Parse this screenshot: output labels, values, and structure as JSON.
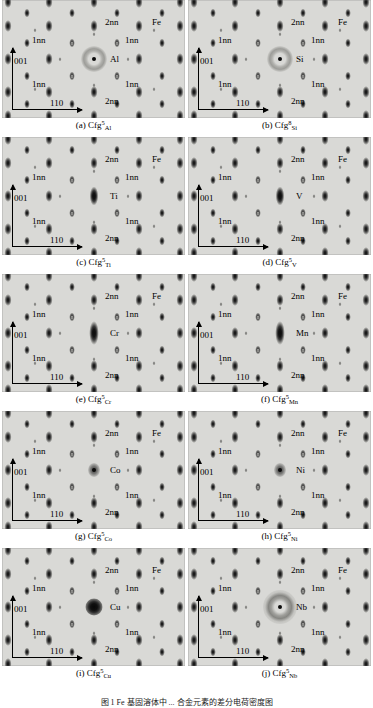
{
  "figure": {
    "width": 373,
    "height": 708,
    "title_partial": "图 1  Fe 基固溶体中 ... 合金元素的差分电荷密度图",
    "background": "#d9d9d6",
    "columns": 2,
    "rows": 5
  },
  "common_labels": {
    "host_atom": "Fe",
    "first_neighbor": "1nn",
    "second_neighbor": "2nn",
    "axis_vertical": "001",
    "axis_horizontal": "110"
  },
  "panels": [
    {
      "id": "a",
      "caption_prefix": "(a)",
      "caption_base": "Cfg",
      "caption_sup": "5",
      "caption_sub": "Al",
      "solute": "Al",
      "center_style": "halo",
      "labels": {
        "axis_vertical": "001",
        "axis_horizontal": "110",
        "host_atom": "Fe",
        "nn1": "1nn",
        "nn2": "2nn"
      }
    },
    {
      "id": "b",
      "caption_prefix": "(b)",
      "caption_base": "Cfg",
      "caption_sup": "8",
      "caption_sub": "Si",
      "solute": "Si",
      "center_style": "halo",
      "labels": {
        "axis_vertical": "001",
        "axis_horizontal": "110",
        "host_atom": "Fe",
        "nn1": "1nn",
        "nn2": "2nn"
      }
    },
    {
      "id": "c",
      "caption_prefix": "(c)",
      "caption_base": "Cfg",
      "caption_sup": "5",
      "caption_sub": "Ti",
      "solute": "Ti",
      "center_style": "bar",
      "labels": {
        "axis_vertical": "001",
        "axis_horizontal": "110",
        "host_atom": "Fe",
        "nn1": "1nn",
        "nn2": "2nn"
      }
    },
    {
      "id": "d",
      "caption_prefix": "(d)",
      "caption_base": "Cfg",
      "caption_sup": "5",
      "caption_sub": "V",
      "solute": "V",
      "center_style": "bar",
      "labels": {
        "axis_vertical": "001",
        "axis_horizontal": "110",
        "host_atom": "Fe",
        "nn1": "1nn",
        "nn2": "2nn"
      }
    },
    {
      "id": "e",
      "caption_prefix": "(e)",
      "caption_base": "Cfg",
      "caption_sup": "5",
      "caption_sub": "Cr",
      "solute": "Cr",
      "center_style": "bar-tall",
      "labels": {
        "axis_vertical": "001",
        "axis_horizontal": "110",
        "host_atom": "Fe",
        "nn1": "1nn",
        "nn2": "2nn"
      }
    },
    {
      "id": "f",
      "caption_prefix": "(f)",
      "caption_base": "Cfg",
      "caption_sup": "5",
      "caption_sub": "Mn",
      "solute": "Mn",
      "center_style": "bar-tall",
      "labels": {
        "axis_vertical": "001",
        "axis_horizontal": "110",
        "host_atom": "Fe",
        "nn1": "1nn",
        "nn2": "2nn"
      }
    },
    {
      "id": "g",
      "caption_prefix": "(g)",
      "caption_base": "Cfg",
      "caption_sup": "5",
      "caption_sub": "Co",
      "solute": "Co",
      "center_style": "faint-dot",
      "labels": {
        "axis_vertical": "001",
        "axis_horizontal": "110",
        "host_atom": "Fe",
        "nn1": "1nn",
        "nn2": "2nn"
      }
    },
    {
      "id": "h",
      "caption_prefix": "(h)",
      "caption_base": "Cfg",
      "caption_sup": "5",
      "caption_sub": "Ni",
      "solute": "Ni",
      "center_style": "faint-dot",
      "labels": {
        "axis_vertical": "001",
        "axis_horizontal": "110",
        "host_atom": "Fe",
        "nn1": "1nn",
        "nn2": "2nn"
      }
    },
    {
      "id": "i",
      "caption_prefix": "(i)",
      "caption_base": "Cfg",
      "caption_sup": "5",
      "caption_sub": "Cu",
      "solute": "Cu",
      "center_style": "blob",
      "labels": {
        "axis_vertical": "001",
        "axis_horizontal": "110",
        "host_atom": "Fe",
        "nn1": "1nn",
        "nn2": "2nn"
      }
    },
    {
      "id": "j",
      "caption_prefix": "(j)",
      "caption_base": "Cfg",
      "caption_sup": "5",
      "caption_sub": "Nb",
      "solute": "Nb",
      "center_style": "halo-wide",
      "labels": {
        "axis_vertical": "001",
        "axis_horizontal": "110",
        "host_atom": "Fe",
        "nn1": "1nn",
        "nn2": "2nn"
      }
    }
  ]
}
